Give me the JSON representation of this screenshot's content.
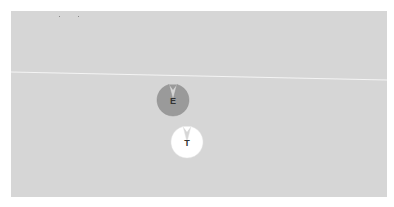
{
  "board": {
    "background": "#d6d6d6",
    "line_color": "#f4f4f4"
  },
  "pieces": [
    {
      "label": "E",
      "fill": "#9a9a9a",
      "x": 154,
      "y": 81
    },
    {
      "label": "T",
      "fill": "#ffffff",
      "x": 168,
      "y": 123
    }
  ]
}
